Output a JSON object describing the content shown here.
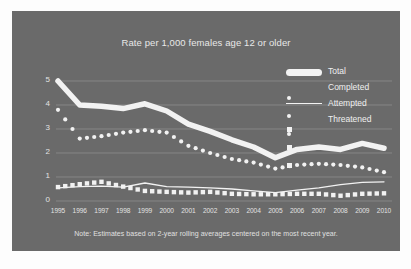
{
  "chart_data": {
    "type": "line",
    "title": "Rate per 1,000 females age 12 or older",
    "xlabel": "",
    "ylabel": "",
    "ylim": [
      0,
      5
    ],
    "yticks": [
      0,
      1,
      2,
      3,
      4,
      5
    ],
    "grid": true,
    "legend_position": "top-right",
    "note": "Note: Estimates based on 2-year rolling averages centered on the most recent year.",
    "categories": [
      "1995",
      "1996",
      "1997",
      "1998",
      "1999",
      "2000",
      "2001",
      "2002",
      "2003",
      "2004",
      "2005",
      "2006",
      "2007",
      "2008",
      "2009",
      "2010"
    ],
    "series": [
      {
        "name": "Total",
        "style": "thick-line",
        "values": [
          5.0,
          4.0,
          3.95,
          3.85,
          4.05,
          3.75,
          3.2,
          2.9,
          2.55,
          2.25,
          1.8,
          2.15,
          2.25,
          2.15,
          2.4,
          2.2
        ]
      },
      {
        "name": "Completed",
        "style": "dotted",
        "values": [
          3.8,
          2.6,
          2.7,
          2.85,
          2.95,
          2.85,
          2.3,
          2.0,
          1.75,
          1.6,
          1.35,
          1.5,
          1.55,
          1.5,
          1.4,
          1.2
        ]
      },
      {
        "name": "Attempted",
        "style": "thin-line",
        "values": [
          0.55,
          0.6,
          0.62,
          0.58,
          0.75,
          0.6,
          0.58,
          0.55,
          0.5,
          0.42,
          0.35,
          0.45,
          0.55,
          0.68,
          0.78,
          0.8
        ]
      },
      {
        "name": "Threatened",
        "style": "squares",
        "values": [
          0.58,
          0.7,
          0.8,
          0.6,
          0.42,
          0.38,
          0.35,
          0.38,
          0.3,
          0.28,
          0.28,
          0.3,
          0.3,
          0.22,
          0.3,
          0.32
        ]
      }
    ]
  },
  "legend": {
    "items": [
      {
        "label": "Total",
        "marker": "thick-line-marker"
      },
      {
        "label": "Completed",
        "marker": "dots-marker"
      },
      {
        "label": "Attempted",
        "marker": "thin-line-marker"
      },
      {
        "label": "Threatened",
        "marker": "squares-marker"
      }
    ]
  },
  "colors": {
    "panel_background": "#6a6a6a",
    "series": "#f2f2f2",
    "grid": "#8e8e8e",
    "text": "#e8e8e8"
  }
}
